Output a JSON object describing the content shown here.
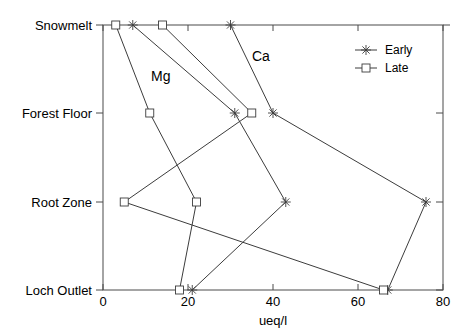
{
  "chart_data": {
    "type": "line",
    "title": "",
    "xlabel": "ueq/l",
    "ylabel": "",
    "xlim": [
      0,
      80
    ],
    "xticks": [
      0,
      20,
      40,
      60,
      80
    ],
    "xtick_labels": [
      "0",
      "20",
      "40",
      "60",
      "80"
    ],
    "categories": [
      "Snowmelt",
      "Forest Floor",
      "Root Zone",
      "Loch Outlet"
    ],
    "grid": false,
    "legend_position": "top-right",
    "legend_entries": [
      {
        "label": "Early",
        "marker": "star"
      },
      {
        "label": "Late",
        "marker": "square"
      }
    ],
    "annotations": [
      {
        "text": "Mg",
        "x": 12,
        "category_between": "Snowmelt-Forest Floor"
      },
      {
        "text": "Ca",
        "x": 36,
        "category_between": "Snowmelt-Forest Floor"
      }
    ],
    "series": [
      {
        "name": "Ca Early",
        "element": "Ca",
        "season": "Early",
        "marker": "star",
        "values": [
          30,
          40,
          76,
          67
        ]
      },
      {
        "name": "Ca Late",
        "element": "Ca",
        "season": "Late",
        "marker": "square",
        "values": [
          14,
          35,
          5,
          66
        ]
      },
      {
        "name": "Mg Early",
        "element": "Mg",
        "season": "Early",
        "marker": "star",
        "values": [
          7,
          31,
          43,
          21
        ]
      },
      {
        "name": "Mg Late",
        "element": "Mg",
        "season": "Late",
        "marker": "square",
        "values": [
          3,
          11,
          22,
          18
        ]
      }
    ]
  },
  "axis": {
    "x_title": "ueq/l",
    "x_tick_0": "0",
    "x_tick_1": "20",
    "x_tick_2": "40",
    "x_tick_3": "60",
    "x_tick_4": "80",
    "y_cat_0": "Snowmelt",
    "y_cat_1": "Forest Floor",
    "y_cat_2": "Root Zone",
    "y_cat_3": "Loch Outlet"
  },
  "legend": {
    "early_label": "Early",
    "late_label": "Late"
  },
  "annotations": {
    "mg_label": "Mg",
    "ca_label": "Ca"
  },
  "colors": {
    "line": "#3c3c3c",
    "axis": "#4a4a4a",
    "text": "#000000",
    "background": "#ffffff"
  }
}
